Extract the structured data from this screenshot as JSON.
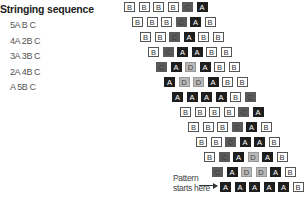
{
  "title": "Stringing sequence",
  "sequence": [
    "5A B C",
    "4A 2B C",
    "3A 3B C",
    "2A 4B C",
    "A 5B C"
  ],
  "colors": {
    "A": "#1e1e1e",
    "B": "#ffffff",
    "C": "#5a5a5a",
    "D": "#b8b8b8"
  },
  "rows": [
    {
      "x": 124,
      "y": 6,
      "beads": [
        "B",
        "B",
        "B",
        "B",
        "C",
        "A"
      ]
    },
    {
      "x": 132,
      "y": 21,
      "beads": [
        "B",
        "B",
        "B",
        "C",
        "A",
        "B"
      ]
    },
    {
      "x": 140,
      "y": 36,
      "beads": [
        "B",
        "B",
        "C",
        "A",
        "B",
        "B"
      ]
    },
    {
      "x": 148,
      "y": 51,
      "beads": [
        "B",
        "C",
        "A",
        "A",
        "B",
        "B"
      ]
    },
    {
      "x": 156,
      "y": 66,
      "beads": [
        "C",
        "A",
        "D",
        "A",
        "B",
        "B"
      ]
    },
    {
      "x": 164,
      "y": 81,
      "beads": [
        "A",
        "D",
        "D",
        "A",
        "B",
        "B"
      ]
    },
    {
      "x": 172,
      "y": 96,
      "beads": [
        "A",
        "A",
        "A",
        "A",
        "B",
        "C"
      ]
    },
    {
      "x": 180,
      "y": 111,
      "beads": [
        "B",
        "B",
        "B",
        "B",
        "C",
        "A"
      ]
    },
    {
      "x": 188,
      "y": 126,
      "beads": [
        "B",
        "B",
        "B",
        "C",
        "A",
        "B"
      ]
    },
    {
      "x": 196,
      "y": 141,
      "beads": [
        "B",
        "B",
        "C",
        "A",
        "A",
        "B"
      ]
    },
    {
      "x": 204,
      "y": 156,
      "beads": [
        "B",
        "C",
        "A",
        "D",
        "A",
        "B"
      ]
    },
    {
      "x": 212,
      "y": 171,
      "beads": [
        "C",
        "A",
        "D",
        "D",
        "A",
        "B"
      ]
    },
    {
      "x": 220,
      "y": 186,
      "beads": [
        "A",
        "A",
        "A",
        "A",
        "A",
        "B"
      ]
    }
  ],
  "start_label": {
    "line1": "Pattern",
    "line2": "starts here"
  }
}
